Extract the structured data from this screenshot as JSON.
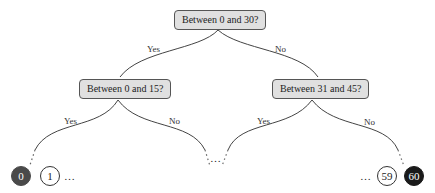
{
  "nodes": {
    "root": "Between 0 and 30?",
    "left": "Between 0 and 15?",
    "right": "Between 31 and 45?"
  },
  "edges": {
    "root_yes": "Yes",
    "root_no": "No",
    "left_yes": "Yes",
    "left_no": "No",
    "right_yes": "Yes",
    "right_no": "No"
  },
  "leaves": {
    "l0": "0",
    "l1": "1",
    "l59": "59",
    "l60": "60"
  },
  "ellipsis": "…",
  "colors": {
    "node_fill": "#e0e0e0",
    "leaf_0": "#4a4a4a",
    "leaf_60": "#1a1a1a"
  }
}
